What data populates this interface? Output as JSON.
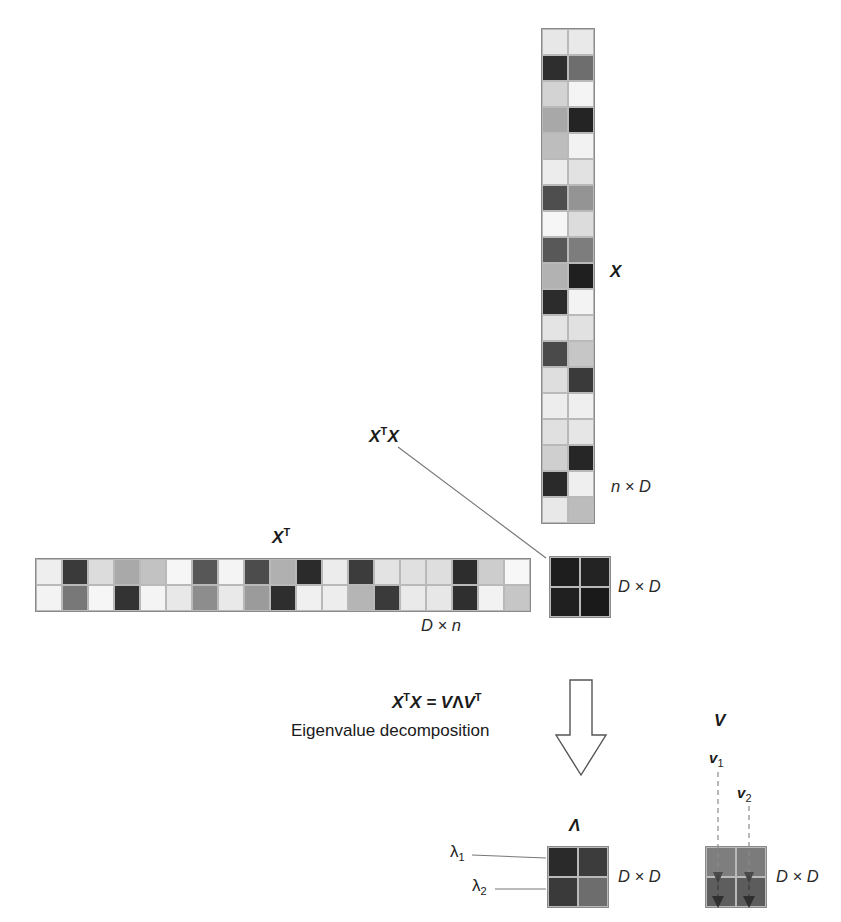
{
  "figure": {
    "background": "#ffffff",
    "grid_line_color": "#b9b9b9",
    "outline_color": "#8a8a8a",
    "arrow_color": "#4a4a4a"
  },
  "matrices": {
    "X": {
      "name": "X",
      "dim_label": "n × D",
      "rows": 19,
      "cols": 2,
      "x": 541,
      "y": 28,
      "cell": 26,
      "values": [
        [
          "#e7e7e7",
          "#e9e9e9"
        ],
        [
          "#2e2e2e",
          "#6e6e6e"
        ],
        [
          "#d3d3d3",
          "#f4f4f4"
        ],
        [
          "#a8a8a8",
          "#242424"
        ],
        [
          "#bdbdbd",
          "#f2f2f2"
        ],
        [
          "#ececec",
          "#e2e2e2"
        ],
        [
          "#4e4e4e",
          "#949494"
        ],
        [
          "#f6f6f6",
          "#dcdcdc"
        ],
        [
          "#585858",
          "#7d7d7d"
        ],
        [
          "#b2b2b2",
          "#1f1f1f"
        ],
        [
          "#2c2c2c",
          "#f3f3f3"
        ],
        [
          "#e4e4e4",
          "#e1e1e1"
        ],
        [
          "#4a4a4a",
          "#c6c6c6"
        ],
        [
          "#dedede",
          "#3a3a3a"
        ],
        [
          "#ededed",
          "#efefef"
        ],
        [
          "#e0e0e0",
          "#e6e6e6"
        ],
        [
          "#cfcfcf",
          "#262626"
        ],
        [
          "#2a2a2a",
          "#efefef"
        ],
        [
          "#e8e8e8",
          "#bcbcbc"
        ]
      ]
    },
    "XT": {
      "name": "X",
      "name_superscript": "T",
      "dim_label": "D × n",
      "rows": 2,
      "cols": 19,
      "x": 35,
      "y": 558,
      "cell": 26,
      "values": [
        [
          "#eeeeee",
          "#3a3a3a",
          "#dcdcdc",
          "#a9a9a9",
          "#c2c2c2",
          "#f6f6f6",
          "#575757",
          "#f4f4f4",
          "#4c4c4c",
          "#b0b0b0",
          "#2b2b2b",
          "#ececec",
          "#3c3c3c",
          "#e3e3e3",
          "#e0e0e0",
          "#dedede",
          "#2d2d2d",
          "#cdcdcd",
          "#f7f7f7"
        ],
        [
          "#f3f3f3",
          "#787878",
          "#f6f6f6",
          "#333333",
          "#f4f4f4",
          "#e8e8e8",
          "#8d8d8d",
          "#e9e9e9",
          "#9b9b9b",
          "#2e2e2e",
          "#f0f0f0",
          "#ededed",
          "#b5b5b5",
          "#3a3a3a",
          "#eaeaea",
          "#e7e7e7",
          "#2f2f2f",
          "#f2f2f2",
          "#c6c6c6"
        ]
      ]
    },
    "XTX": {
      "name": "X",
      "name_superscript": "T",
      "name2": "X",
      "dim_label": "D × D",
      "rows": 2,
      "cols": 2,
      "x": 549,
      "y": 556,
      "cell": 30,
      "values": [
        [
          "#1e1e1e",
          "#232323"
        ],
        [
          "#202020",
          "#1a1a1a"
        ]
      ]
    },
    "Lambda": {
      "name": "Λ",
      "dim_label": "D × D",
      "rows": 2,
      "cols": 2,
      "x": 547,
      "y": 846,
      "cell": 30,
      "values": [
        [
          "#2a2a2a",
          "#3c3c3c"
        ],
        [
          "#3a3a3a",
          "#6d6d6d"
        ]
      ],
      "eigen_labels": [
        "λ",
        "λ"
      ],
      "eigen_subs": [
        "1",
        "2"
      ]
    },
    "V": {
      "name": "V",
      "dim_label": "D × D",
      "rows": 2,
      "cols": 2,
      "x": 705,
      "y": 846,
      "cell": 30,
      "values": [
        [
          "#7e7e7e",
          "#7b7b7b"
        ],
        [
          "#5e5e5e",
          "#5c5c5c"
        ]
      ],
      "vector_labels": [
        "v",
        "v"
      ],
      "vector_subs": [
        "1",
        "2"
      ]
    }
  },
  "annotations": {
    "equation_main": "X",
    "equation_sup1": "T",
    "equation_mid": "X = V",
    "equation_lambda": "Λ",
    "equation_v": "V",
    "equation_sup2": "T",
    "eigen_caption": "Eigenvalue decomposition",
    "xtx_pointer_label": "X",
    "xtx_pointer_sup": "T",
    "xtx_pointer_label2": "X"
  },
  "icons": {
    "down_block_arrow": "down-block-arrow",
    "connector_line": "connector-line",
    "dashed_vector_arrow": "dashed-vector-arrow"
  }
}
